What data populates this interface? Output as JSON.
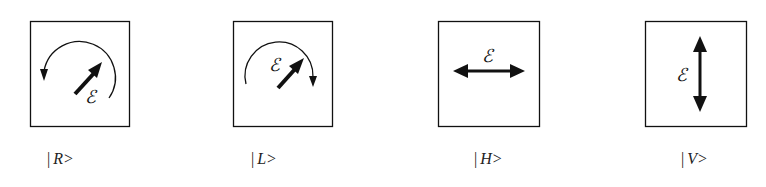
{
  "figure": {
    "field_symbol": "ℰ",
    "panels": [
      {
        "id": "R",
        "ket": "|R>",
        "bar": "|",
        "name": "R>",
        "description": "right circular polarization"
      },
      {
        "id": "L",
        "ket": "|L>",
        "bar": "|",
        "name": "L>",
        "description": "left circular polarization"
      },
      {
        "id": "H",
        "ket": "|H>",
        "bar": "|",
        "name": "H>",
        "description": "horizontal linear polarization"
      },
      {
        "id": "V",
        "ket": "|V>",
        "bar": "|",
        "name": "V>",
        "description": "vertical linear polarization"
      }
    ],
    "stroke_color": "#111111",
    "background": "#ffffff"
  }
}
